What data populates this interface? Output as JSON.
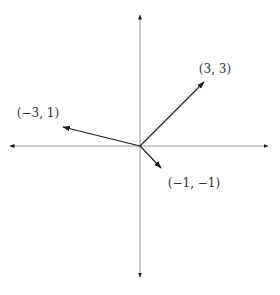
{
  "diagram": {
    "type": "vector-plot",
    "colors": {
      "axis": "#9a9a9a",
      "vector": "#1a1a1a",
      "label": "#333333"
    },
    "origin_px": [
      140,
      146
    ],
    "axes": {
      "x": {
        "from": [
          10,
          146
        ],
        "to": [
          268,
          146
        ],
        "arrows": "both"
      },
      "y": {
        "from": [
          140,
          15
        ],
        "to": [
          140,
          277
        ],
        "arrows": "both"
      }
    },
    "vectors": [
      {
        "label": "(3, 3)",
        "tip_px": [
          204,
          82
        ],
        "label_px": [
          215,
          69
        ]
      },
      {
        "label": "(−3, 1)",
        "tip_px": [
          63,
          127
        ],
        "label_px": [
          38,
          113
        ]
      },
      {
        "label": "(−1, −1)",
        "tip_px": [
          161,
          168
        ],
        "label_px": [
          194,
          183
        ]
      }
    ]
  }
}
